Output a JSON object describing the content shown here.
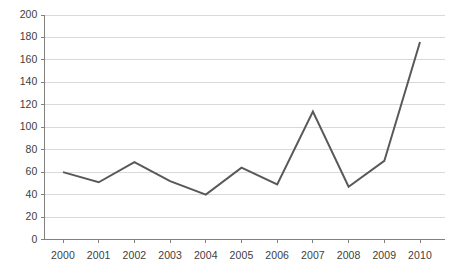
{
  "chart_data": {
    "type": "line",
    "title": "",
    "subtitle": "",
    "xlabel": "",
    "ylabel": "",
    "categories": [
      "2000",
      "2001",
      "2002",
      "2003",
      "2004",
      "2005",
      "2006",
      "2007",
      "2008",
      "2009",
      "2010"
    ],
    "values": [
      60,
      51,
      69,
      52,
      40,
      64,
      49,
      114,
      47,
      70,
      176
    ],
    "series": [
      {
        "name": "",
        "values": [
          60,
          51,
          69,
          52,
          40,
          64,
          49,
          114,
          47,
          70,
          176
        ]
      }
    ],
    "ylim": [
      0,
      200
    ],
    "ytick_values": [
      0,
      20,
      40,
      60,
      80,
      100,
      120,
      140,
      160,
      180,
      200
    ],
    "ytick_labels": [
      "0",
      "20",
      "40",
      "60",
      "80",
      "100",
      "120",
      "140",
      "160",
      "180",
      "200"
    ],
    "xtick_labels": [
      "2000",
      "2001",
      "2002",
      "2003",
      "2004",
      "2005",
      "2006",
      "2007",
      "2008",
      "2009",
      "2010"
    ],
    "grid": "horizontal",
    "legend": "none",
    "markers": "none",
    "colors": {
      "line": "#595959",
      "gridline": "#d9d9d9",
      "axis": "#808080",
      "tick_text": "#404040",
      "background": "#ffffff"
    },
    "line_width": 2
  }
}
